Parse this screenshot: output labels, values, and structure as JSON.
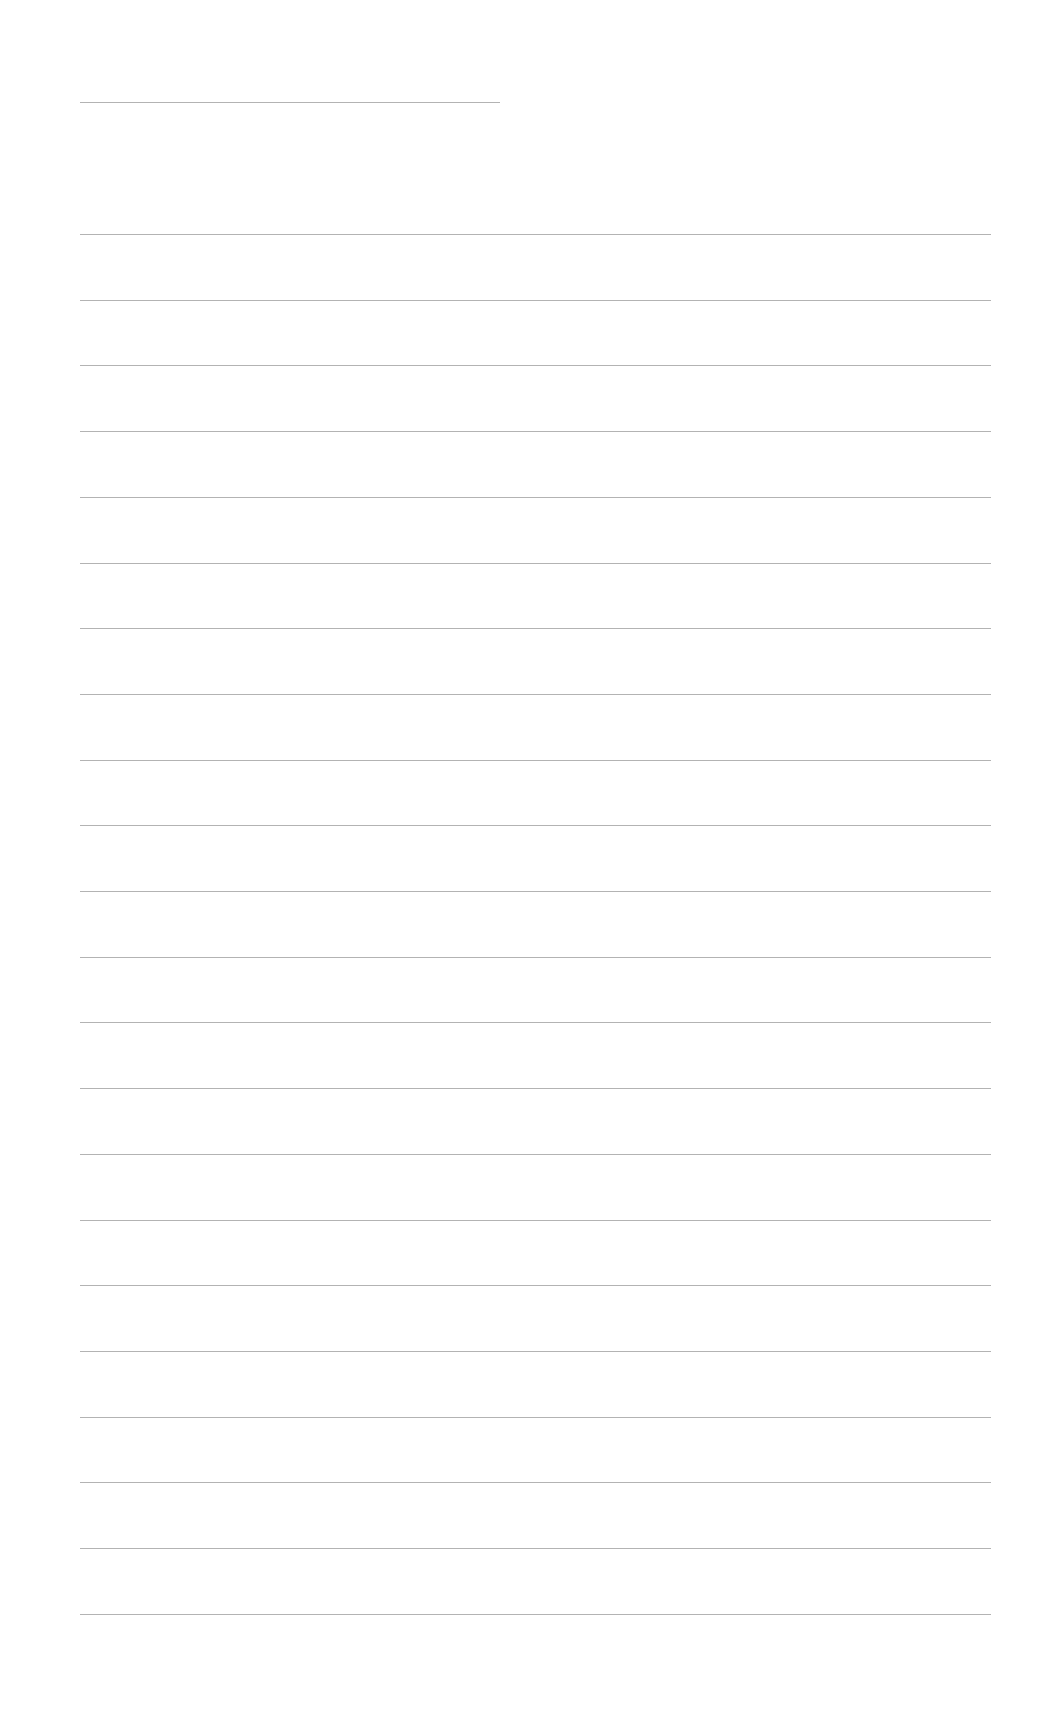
{
  "page": {
    "type": "blank ruled sheet",
    "background": "#ffffff",
    "rule_color": "#9a9a9a",
    "header_rule": {
      "left": 80,
      "width": 420,
      "top": 102
    },
    "rules": {
      "left": 80,
      "width": 911,
      "first_top": 234,
      "spacing": 65.7,
      "count": 22
    }
  }
}
